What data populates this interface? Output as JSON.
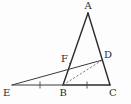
{
  "figure": {
    "type": "geometry-diagram",
    "width": 131,
    "height": 104,
    "background_color": "#fdfdfd",
    "stroke_color": "#2b2b2b",
    "dashed_stroke_color": "#6a6a6a",
    "tick_color": "#4a4a4a"
  },
  "points": {
    "A": {
      "label": "A",
      "x": 88,
      "y": 13,
      "label_x": 84.5,
      "label_y": 1
    },
    "B": {
      "label": "B",
      "x": 63,
      "y": 85,
      "label_x": 59.5,
      "label_y": 88
    },
    "C": {
      "label": "C",
      "x": 110,
      "y": 85,
      "label_x": 109,
      "label_y": 88
    },
    "D": {
      "label": "D",
      "x": 102.5,
      "y": 60,
      "label_x": 104,
      "label_y": 50
    },
    "E": {
      "label": "E",
      "x": 12,
      "y": 85,
      "label_x": 3,
      "label_y": 88
    },
    "F": {
      "label": "F",
      "x": 70,
      "y": 63.5,
      "label_x": 61,
      "label_y": 54
    }
  },
  "segments": [
    {
      "name": "side-AB",
      "from": "A",
      "to": "B",
      "style": "solid"
    },
    {
      "name": "side-AC",
      "from": "A",
      "to": "C",
      "style": "solid"
    },
    {
      "name": "side-BC",
      "from": "B",
      "to": "C",
      "style": "solid"
    },
    {
      "name": "segment-EC-baseline",
      "from": "E",
      "to": "B",
      "style": "solid"
    },
    {
      "name": "transversal-ED",
      "from": "E",
      "to": "D",
      "style": "solid"
    },
    {
      "name": "segment-BD",
      "from": "B",
      "to": "D",
      "style": "dashed"
    }
  ],
  "tick_marks": [
    {
      "name": "tick-EB-midpoint",
      "x": 40,
      "y": 85
    },
    {
      "name": "tick-BC-midpoint",
      "x": 87,
      "y": 85
    }
  ]
}
